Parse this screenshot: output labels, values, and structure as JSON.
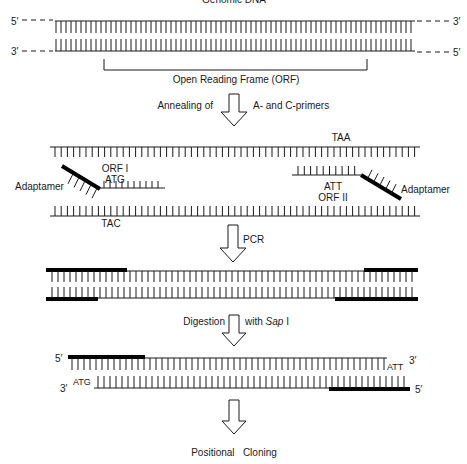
{
  "title": "Genomic DNA",
  "colors": {
    "line": "#1a1a1a",
    "adaptamer": "#000000",
    "background": "#ffffff"
  },
  "genomic": {
    "top_left_end": "5′",
    "top_right_end": "3′",
    "bottom_left_end": "3′",
    "bottom_right_end": "5′",
    "orf_label": "Open Reading Frame (ORF)"
  },
  "steps": [
    {
      "id": "annealing",
      "left_label": "Annealing of",
      "right_label": "A- and C-primers"
    },
    {
      "id": "pcr",
      "left_label": "",
      "right_label": "PCR"
    },
    {
      "id": "digestion",
      "left_label": "Digestion",
      "right_label": "with",
      "right_label_italic": "Sap",
      "right_label_suffix": " I"
    },
    {
      "id": "cloning",
      "left_label": "",
      "right_label": ""
    }
  ],
  "annealing": {
    "top_codon": "TAA",
    "bottom_codon": "TAC",
    "left_primer": {
      "label": "Adaptamer",
      "orf": "ORF I",
      "codon": "ATG"
    },
    "right_primer": {
      "label": "Adaptamer",
      "orf": "ORF II",
      "codon": "ATT"
    }
  },
  "digested": {
    "top_left_end": "5′",
    "top_right_end": "3′",
    "top_right_codon": "ATT",
    "bottom_left_end": "3′",
    "bottom_left_codon": "ATG",
    "bottom_right_end": "5′"
  },
  "final_label": "Positional   Cloning"
}
